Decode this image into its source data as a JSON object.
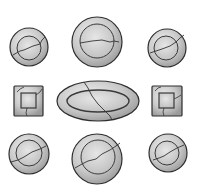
{
  "illustration": {
    "subject": "broken plates",
    "colors": {
      "background": "#ffffff",
      "dish_fill_light": "#e2e2e2",
      "dish_fill_dark": "#a8a8a8",
      "outline": "#333333",
      "crack": "#3a3a3a"
    },
    "dishes": [
      {
        "shape": "circle",
        "cx": 29,
        "cy": 47,
        "r": 19,
        "inner_r": 12
      },
      {
        "shape": "circle",
        "cx": 97,
        "cy": 42,
        "r": 25,
        "inner_r": 17
      },
      {
        "shape": "circle",
        "cx": 167,
        "cy": 48,
        "r": 19,
        "inner_r": 12
      },
      {
        "shape": "square",
        "x": 14,
        "y": 86,
        "w": 29,
        "h": 30,
        "inner": 14
      },
      {
        "shape": "oval",
        "cx": 98,
        "cy": 101,
        "rx": 41,
        "ry": 20,
        "inner_rx": 31,
        "inner_ry": 11
      },
      {
        "shape": "square",
        "x": 152,
        "y": 86,
        "w": 30,
        "h": 30,
        "inner": 14
      },
      {
        "shape": "circle",
        "cx": 29,
        "cy": 154,
        "r": 20,
        "inner_r": 13
      },
      {
        "shape": "circle",
        "cx": 97,
        "cy": 159,
        "r": 25,
        "inner_r": 17
      },
      {
        "shape": "circle",
        "cx": 168,
        "cy": 153,
        "r": 19,
        "inner_r": 13
      }
    ]
  }
}
